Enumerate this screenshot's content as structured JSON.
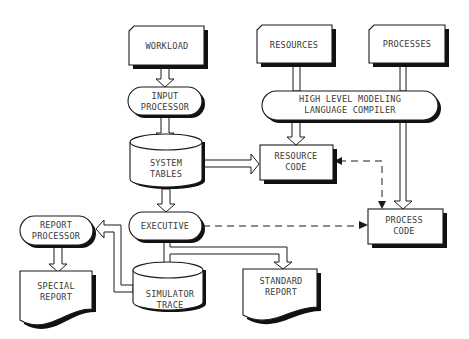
{
  "diagram": {
    "type": "flowchart",
    "nodes": {
      "workload": {
        "lines": [
          "WORKLOAD"
        ],
        "shape": "manual-input"
      },
      "resources": {
        "lines": [
          "RESOURCES"
        ],
        "shape": "manual-input"
      },
      "processes": {
        "lines": [
          "PROCESSES"
        ],
        "shape": "manual-input"
      },
      "input_processor": {
        "lines": [
          "INPUT",
          "PROCESSOR"
        ],
        "shape": "terminal"
      },
      "compiler": {
        "lines": [
          "HIGH LEVEL MODELING",
          "LANGUAGE COMPILER"
        ],
        "shape": "terminal"
      },
      "system_tables": {
        "lines": [
          "SYSTEM",
          "TABLES"
        ],
        "shape": "cylinder"
      },
      "resource_code": {
        "lines": [
          "RESOURCE",
          "CODE"
        ],
        "shape": "process"
      },
      "process_code": {
        "lines": [
          "PROCESS",
          "CODE"
        ],
        "shape": "process"
      },
      "executive": {
        "lines": [
          "EXECUTIVE"
        ],
        "shape": "terminal"
      },
      "report_processor": {
        "lines": [
          "REPORT",
          "PROCESSOR"
        ],
        "shape": "terminal"
      },
      "simulator_trace": {
        "lines": [
          "SIMULATOR",
          "TRACE"
        ],
        "shape": "cylinder"
      },
      "special_report": {
        "lines": [
          "SPECIAL",
          "REPORT"
        ],
        "shape": "document"
      },
      "standard_report": {
        "lines": [
          "STANDARD",
          "REPORT"
        ],
        "shape": "document"
      }
    },
    "edges": [
      {
        "from": "WORKLOAD",
        "to": "INPUT PROCESSOR",
        "style": "solid-hollow"
      },
      {
        "from": "INPUT PROCESSOR",
        "to": "SYSTEM TABLES",
        "style": "solid-hollow"
      },
      {
        "from": "RESOURCES",
        "to": "HIGH LEVEL MODELING LANGUAGE COMPILER",
        "style": "solid-hollow"
      },
      {
        "from": "PROCESSES",
        "to": "HIGH LEVEL MODELING LANGUAGE COMPILER",
        "style": "solid-hollow"
      },
      {
        "from": "HIGH LEVEL MODELING LANGUAGE COMPILER",
        "to": "RESOURCE CODE",
        "style": "solid-hollow"
      },
      {
        "from": "HIGH LEVEL MODELING LANGUAGE COMPILER",
        "to": "PROCESS CODE",
        "style": "solid-hollow"
      },
      {
        "from": "SYSTEM TABLES",
        "to": "RESOURCE CODE",
        "style": "solid-hollow"
      },
      {
        "from": "SYSTEM TABLES",
        "to": "EXECUTIVE",
        "style": "solid-hollow"
      },
      {
        "from": "RESOURCE CODE",
        "to": "PROCESS CODE",
        "style": "dashed-bidirectional"
      },
      {
        "from": "EXECUTIVE",
        "to": "PROCESS CODE",
        "style": "dashed"
      },
      {
        "from": "EXECUTIVE",
        "to": "SIMULATOR TRACE",
        "style": "solid-hollow"
      },
      {
        "from": "EXECUTIVE",
        "to": "STANDARD REPORT",
        "style": "solid-hollow"
      },
      {
        "from": "SIMULATOR TRACE",
        "to": "REPORT PROCESSOR",
        "style": "solid-hollow"
      },
      {
        "from": "REPORT PROCESSOR",
        "to": "SPECIAL REPORT",
        "style": "solid-hollow"
      }
    ]
  }
}
